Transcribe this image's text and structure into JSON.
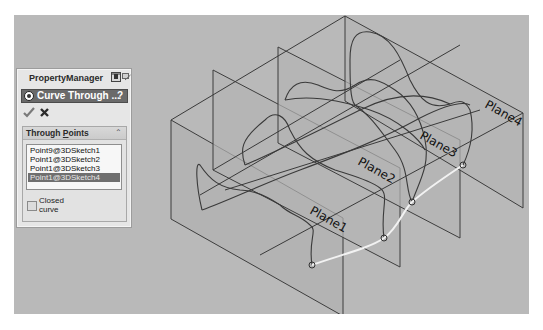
{
  "viewport": {
    "background": "#b9b9b9",
    "planes": [
      {
        "label": "Plane1"
      },
      {
        "label": "Plane2"
      },
      {
        "label": "Plane3"
      },
      {
        "label": "Plane4"
      }
    ],
    "curve_color": "#f2f2f2",
    "points_screen": [
      [
        312,
        265
      ],
      [
        384,
        238
      ],
      [
        412,
        202
      ],
      [
        463,
        165
      ]
    ]
  },
  "property_manager": {
    "title": "PropertyManager",
    "feature": {
      "name": "Curve Through ...",
      "help": "?"
    },
    "ok_icon": "checkmark-icon",
    "cancel_icon": "x-icon",
    "group": {
      "title_prefix": "Through ",
      "title_underlined": "P",
      "title_suffix": "oints",
      "collapse_icon": "«",
      "items": [
        {
          "label": "Point9@3DSketch1",
          "selected": false
        },
        {
          "label": "Point1@3DSketch2",
          "selected": false
        },
        {
          "label": "Point1@3DSketch3",
          "selected": false
        },
        {
          "label": "Point1@3DSketch4",
          "selected": true
        }
      ],
      "closed_curve": {
        "label": "Closed curve",
        "checked": false
      }
    }
  }
}
